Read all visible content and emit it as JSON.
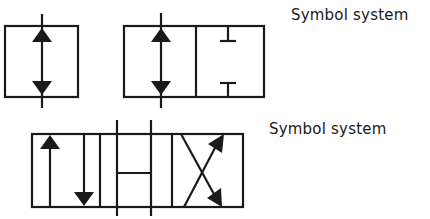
{
  "diagram": {
    "stroke_color": "#1a1a1a",
    "background": "#ffffff",
    "labels": [
      {
        "text": "Symbol system"
      },
      {
        "text": "Symbol system"
      }
    ],
    "symbols": [
      {
        "name": "single-position-valve",
        "envelopes": 1,
        "contents": [
          "two-way flow arrow (up and down)"
        ]
      },
      {
        "name": "two-position-valve",
        "envelopes": 2,
        "contents": [
          "two-way flow arrow (up and down)",
          "blocked ports (T-blocks top and bottom)"
        ]
      },
      {
        "name": "four-way-three-position-valve",
        "envelopes": 3,
        "contents": [
          "parallel flow (up and down arrows)",
          "center position H (tandem/crossbar)",
          "crossed flow (X arrows)"
        ]
      }
    ]
  }
}
